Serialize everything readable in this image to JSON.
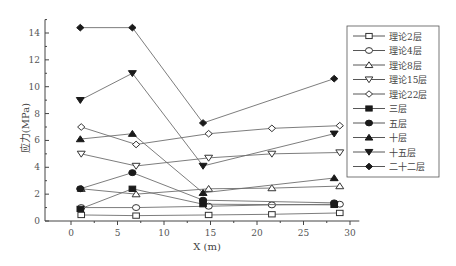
{
  "chart_data": {
    "type": "line",
    "title": "",
    "xlabel": "X (m)",
    "ylabel": "应力(MPa)",
    "xlim": [
      -2.5,
      31
    ],
    "ylim": [
      0,
      15
    ],
    "xticks": [
      0,
      5,
      10,
      15,
      20,
      25,
      30
    ],
    "yticks": [
      0,
      2,
      4,
      6,
      8,
      10,
      12,
      14
    ],
    "grid": false,
    "legend_position": "upper right (inside)",
    "series": [
      {
        "name": "理论2层",
        "marker": "square-open",
        "x": [
          1.1,
          7.0,
          14.8,
          21.6,
          28.9
        ],
        "values": [
          0.45,
          0.4,
          0.45,
          0.5,
          0.6
        ]
      },
      {
        "name": "理论4层",
        "marker": "circle-open",
        "x": [
          1.1,
          7.0,
          14.8,
          21.6,
          28.9
        ],
        "values": [
          1.0,
          1.0,
          1.1,
          1.2,
          1.25
        ]
      },
      {
        "name": "理论8层",
        "marker": "triangle-up-open",
        "x": [
          1.1,
          7.0,
          14.8,
          21.6,
          28.9
        ],
        "values": [
          2.4,
          2.0,
          2.4,
          2.45,
          2.6
        ]
      },
      {
        "name": "理论15层",
        "marker": "triangle-down-open",
        "x": [
          1.1,
          7.0,
          14.8,
          21.6,
          28.9
        ],
        "values": [
          5.0,
          4.1,
          4.7,
          5.0,
          5.1
        ]
      },
      {
        "name": "理论22层",
        "marker": "diamond-open",
        "x": [
          1.1,
          7.0,
          14.8,
          21.6,
          28.9
        ],
        "values": [
          7.0,
          5.7,
          6.5,
          6.9,
          7.1
        ]
      },
      {
        "name": "三层",
        "marker": "square-filled",
        "x": [
          1.0,
          6.6,
          14.2,
          28.3
        ],
        "values": [
          0.9,
          2.4,
          1.25,
          1.2
        ]
      },
      {
        "name": "五层",
        "marker": "circle-filled",
        "x": [
          1.0,
          6.6,
          14.2,
          28.3
        ],
        "values": [
          2.4,
          3.6,
          1.55,
          1.35
        ]
      },
      {
        "name": "十层",
        "marker": "triangle-up-filled",
        "x": [
          1.0,
          6.6,
          14.2,
          28.3
        ],
        "values": [
          6.1,
          6.5,
          2.1,
          3.2
        ]
      },
      {
        "name": "十五层",
        "marker": "triangle-down-filled",
        "x": [
          1.0,
          6.6,
          14.2,
          28.3
        ],
        "values": [
          9.0,
          11.0,
          4.1,
          6.5
        ]
      },
      {
        "name": "二十二层",
        "marker": "diamond-filled",
        "x": [
          1.0,
          6.6,
          14.2,
          28.3
        ],
        "values": [
          14.4,
          14.4,
          7.3,
          10.6
        ]
      }
    ]
  },
  "colors": {
    "line": "#6e6e6e",
    "marker_fill": "#1a1a1a",
    "axis": "#444444",
    "text": "#555555"
  }
}
